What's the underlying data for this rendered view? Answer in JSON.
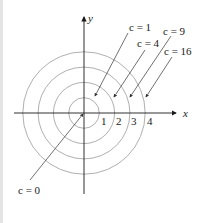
{
  "diagram": {
    "type": "level-curves",
    "axes": {
      "x_label": "x",
      "y_label": "y"
    },
    "tick_labels": [
      "1",
      "2",
      "3",
      "4"
    ],
    "level_labels": [
      {
        "text": "c = 0",
        "radius": 0
      },
      {
        "text": "c = 1",
        "radius": 1
      },
      {
        "text": "c = 4",
        "radius": 2
      },
      {
        "text": "c = 9",
        "radius": 3
      },
      {
        "text": "c = 16",
        "radius": 4
      }
    ],
    "colors": {
      "axis": "#1a1a1a",
      "circle": "#9a9a9a",
      "leader": "#333333"
    }
  }
}
